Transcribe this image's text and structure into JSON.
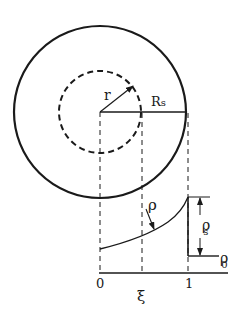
{
  "diagram": {
    "colors": {
      "ink": "#1a1a1a",
      "background": "#ffffff"
    },
    "labels": {
      "r": "r",
      "Rs": "R",
      "Rs_sub": "s",
      "rho": "ρ",
      "rho_s": "ρ",
      "rho_s_sub": "s",
      "rho_0": "ρ",
      "rho_0_sub": "0",
      "axis_0": "0",
      "axis_xi": "ξ",
      "axis_1": "1"
    },
    "elements": {
      "outer_circle": {
        "style": "solid",
        "cx": 100,
        "cy": 112,
        "r": 86
      },
      "inner_circle": {
        "style": "dashed",
        "cx": 100,
        "cy": 112,
        "r": 41
      },
      "radius_line": {
        "from": [
          100,
          112
        ],
        "to": [
          186,
          112
        ]
      },
      "r_arrow": {
        "from": [
          100,
          112
        ],
        "to": [
          134,
          85
        ]
      },
      "projection_lines": [
        "x=0 (center)",
        "x=ξ (inner circle edge)",
        "x=1 (outer circle edge)"
      ],
      "density_curve": "rising curve from x=0 to x=1, then vertical drop to ρ0 baseline"
    }
  }
}
